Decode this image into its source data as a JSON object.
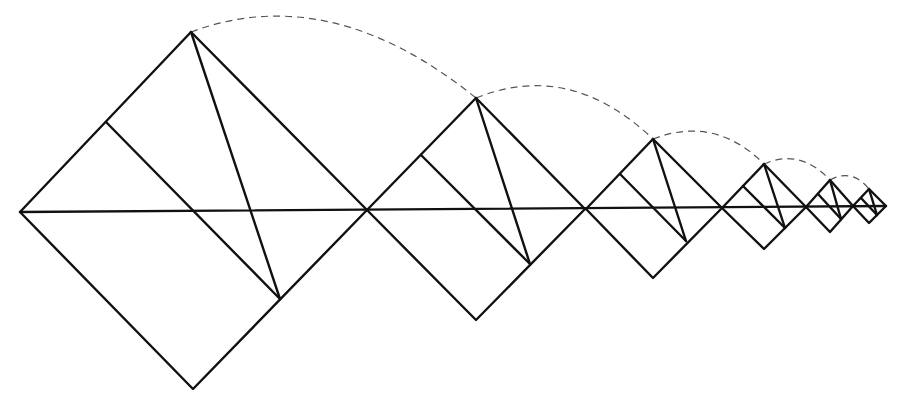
{
  "diagram": {
    "stroke_color": "#111111",
    "arc_color": "#555555",
    "background": "#ffffff",
    "baseline": {
      "x1": 20,
      "y1": 212,
      "x2": 886,
      "y2": 206
    },
    "squares": [
      {
        "left": [
          20,
          212
        ],
        "top": [
          191,
          32
        ],
        "right": [
          367,
          210
        ],
        "bottom": [
          193,
          389
        ],
        "inner": [
          [
            106,
            122
          ],
          [
            280,
            299
          ]
        ],
        "diag": [
          [
            191,
            32
          ],
          [
            280,
            299
          ]
        ]
      },
      {
        "left": [
          367,
          210
        ],
        "top": [
          476,
          98
        ],
        "right": [
          585,
          209
        ],
        "bottom": [
          476,
          320
        ],
        "inner": [
          [
            421,
            155
          ],
          [
            530,
            264
          ]
        ],
        "diag": [
          [
            476,
            98
          ],
          [
            530,
            264
          ]
        ]
      },
      {
        "left": [
          586,
          209
        ],
        "top": [
          653,
          139
        ],
        "right": [
          722,
          208
        ],
        "bottom": [
          653,
          278
        ],
        "inner": [
          [
            620,
            174
          ],
          [
            686,
            241
          ]
        ],
        "diag": [
          [
            653,
            139
          ],
          [
            686,
            241
          ]
        ]
      },
      {
        "left": [
          722,
          208
        ],
        "top": [
          764,
          164
        ],
        "right": [
          806,
          207
        ],
        "bottom": [
          764,
          249
        ],
        "inner": [
          [
            743,
            186
          ],
          [
            785,
            228
          ]
        ],
        "diag": [
          [
            764,
            164
          ],
          [
            785,
            228
          ]
        ]
      },
      {
        "left": [
          806,
          207
        ],
        "top": [
          830,
          180
        ],
        "right": [
          853,
          206
        ],
        "bottom": [
          830,
          232
        ],
        "inner": [
          [
            818,
            194
          ],
          [
            841,
            219
          ]
        ],
        "diag": [
          [
            830,
            180
          ],
          [
            841,
            219
          ]
        ]
      },
      {
        "left": [
          853,
          206
        ],
        "top": [
          869,
          189
        ],
        "right": [
          886,
          206
        ],
        "bottom": [
          869,
          223
        ],
        "inner": [
          [
            861,
            198
          ],
          [
            877,
            215
          ]
        ],
        "diag": [
          [
            869,
            189
          ],
          [
            877,
            215
          ]
        ]
      }
    ],
    "arcs": [
      {
        "from": [
          191,
          32
        ],
        "to": [
          476,
          98
        ],
        "ctrl": [
          330,
          -20
        ]
      },
      {
        "from": [
          476,
          98
        ],
        "to": [
          653,
          139
        ],
        "ctrl": [
          570,
          60
        ]
      },
      {
        "from": [
          653,
          139
        ],
        "to": [
          764,
          164
        ],
        "ctrl": [
          715,
          115
        ]
      },
      {
        "from": [
          764,
          164
        ],
        "to": [
          830,
          180
        ],
        "ctrl": [
          800,
          148
        ]
      },
      {
        "from": [
          830,
          180
        ],
        "to": [
          869,
          189
        ],
        "ctrl": [
          852,
          168
        ]
      }
    ]
  }
}
